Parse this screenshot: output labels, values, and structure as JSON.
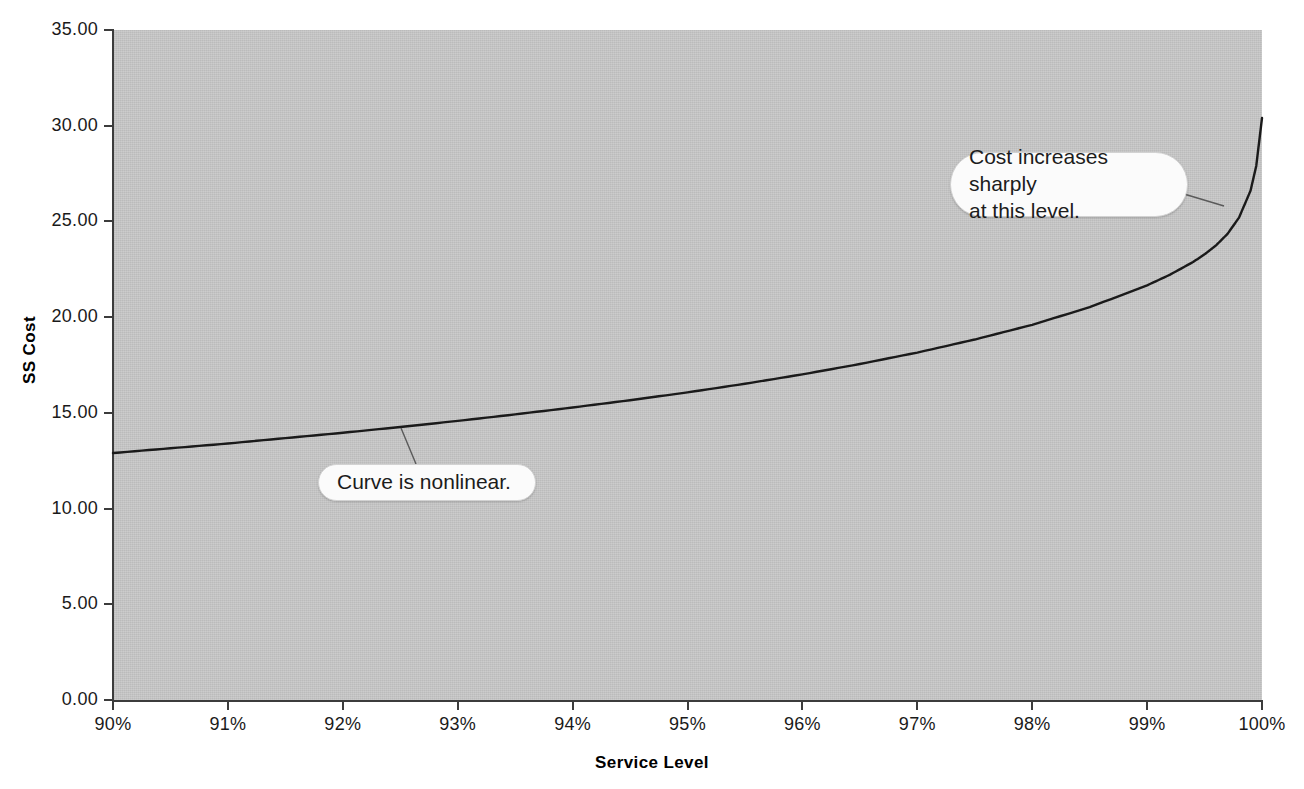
{
  "chart_data": {
    "type": "line",
    "title": "",
    "subtitle": "",
    "xlabel": "Service Level",
    "ylabel": "SS Cost",
    "xlim": [
      90,
      100
    ],
    "ylim": [
      0,
      35
    ],
    "grid": false,
    "legend": null,
    "x_tick_labels": [
      "90%",
      "91%",
      "92%",
      "93%",
      "94%",
      "95%",
      "96%",
      "97%",
      "98%",
      "99%",
      "100%"
    ],
    "x_tick_values": [
      90,
      91,
      92,
      93,
      94,
      95,
      96,
      97,
      98,
      99,
      100
    ],
    "y_tick_labels": [
      "0.00",
      "5.00",
      "10.00",
      "15.00",
      "20.00",
      "25.00",
      "30.00",
      "35.00"
    ],
    "y_tick_values": [
      0,
      5,
      10,
      15,
      20,
      25,
      30,
      35
    ],
    "series": [
      {
        "name": "SS Cost",
        "color": "#1a1a1a",
        "x": [
          90.0,
          90.5,
          91.0,
          91.5,
          92.0,
          92.5,
          93.0,
          93.5,
          94.0,
          94.5,
          95.0,
          95.5,
          96.0,
          96.5,
          97.0,
          97.5,
          98.0,
          98.5,
          99.0,
          99.2,
          99.4,
          99.5,
          99.6,
          99.7,
          99.8,
          99.9,
          99.95,
          100.0
        ],
        "y": [
          12.9,
          13.15,
          13.4,
          13.68,
          13.96,
          14.26,
          14.58,
          14.92,
          15.28,
          15.66,
          16.07,
          16.52,
          17.01,
          17.55,
          18.15,
          18.83,
          19.6,
          20.52,
          21.66,
          22.22,
          22.88,
          23.28,
          23.75,
          24.35,
          25.2,
          26.6,
          27.9,
          30.4
        ]
      }
    ],
    "annotations": [
      {
        "id": "nonlinear",
        "text": "Curve is nonlinear.",
        "shape": "rounded-pill",
        "anchor_x": 92.5,
        "anchor_y": 14.3
      },
      {
        "id": "sharp",
        "text": "Cost increases sharply\nat this level.",
        "shape": "rounded-pill",
        "anchor_x": 99.65,
        "anchor_y": 25.9
      }
    ],
    "colors": {
      "plot_background": "#c8c8c8",
      "figure_background": "#ffffff",
      "axis": "#3c3c3c",
      "line": "#1a1a1a",
      "callout_fill": "#fbfbfb",
      "callout_border": "#d2d2d2",
      "text": "#1a1a1a"
    }
  }
}
